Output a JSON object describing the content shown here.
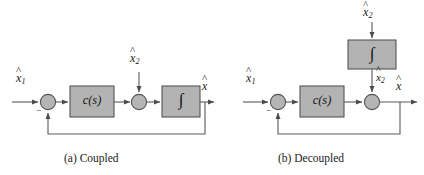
{
  "figure": {
    "background_color": "#ffffff",
    "line_color": "#5a5a5a",
    "block_fill": "#b3b3b3",
    "block_stroke": "#555555",
    "junction_fill": "#b5b5b5",
    "junction_stroke": "#555555",
    "text_color": "#1a1a1a"
  },
  "panels": [
    {
      "id": "a",
      "caption": "(a) Coupled",
      "reference_input_label": "x",
      "reference_input_sub": "1",
      "reference_input_accent": "^",
      "sum_sign": "−",
      "controller_label": "c(s)",
      "injected_input_label": "x",
      "injected_input_sub": "2",
      "injected_input_accent": "^",
      "integrator_label": "∫",
      "output_label": "x",
      "output_sub": "",
      "output_accent": "^",
      "has_feedback_loop": true
    },
    {
      "id": "b",
      "caption": "(b) Decoupled",
      "reference_input_label": "x",
      "reference_input_sub": "1",
      "reference_input_accent": "^",
      "sum_sign": "−",
      "controller_label": "c(s)",
      "top_input_label": "x",
      "top_input_sub": "2",
      "top_input_accent": "^^",
      "integrator_label": "∫",
      "integrator_output_label": "x",
      "integrator_output_sub": "2",
      "integrator_output_accent": "^",
      "output_label": "x",
      "output_sub": "",
      "output_accent": "^",
      "has_feedback_loop": true
    }
  ]
}
